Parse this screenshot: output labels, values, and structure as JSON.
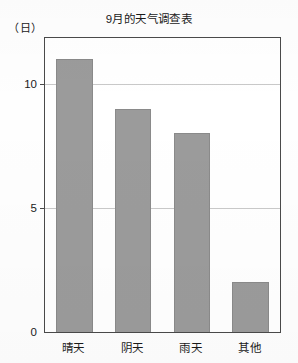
{
  "chart_data": {
    "type": "bar",
    "title": "9月的天气调查表",
    "xlabel": "",
    "ylabel": "（日）",
    "categories": [
      "晴天",
      "阴天",
      "雨天",
      "其他"
    ],
    "values": [
      11,
      9,
      8,
      2
    ],
    "ylim": [
      0,
      11.84
    ],
    "yticks": [
      0,
      5,
      10
    ],
    "ytick_labels": [
      "0",
      "5",
      "10"
    ],
    "grid": true,
    "grid_axis": "y",
    "legend": null,
    "bar_color": "#9b9b9b",
    "bar_edge_color": "#8a8a8a",
    "frame_color": "#4a4a4a",
    "gridline_color": "#c9c9c9",
    "background_color": "#ffffff"
  }
}
